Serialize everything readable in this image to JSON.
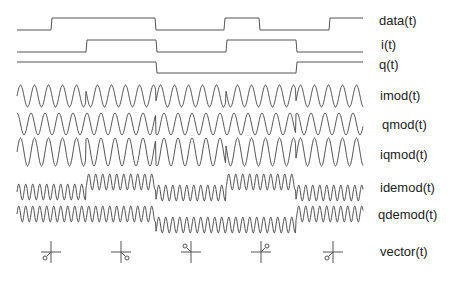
{
  "diagram": {
    "colors": {
      "trace": "#555555",
      "text": "#222222",
      "background": "#ffffff"
    },
    "time_axis": {
      "x_start": 17,
      "x_end": 363,
      "symbol_boundaries": [
        17,
        51,
        86,
        121,
        156,
        191,
        226,
        261,
        296,
        329,
        363
      ]
    },
    "signals": [
      {
        "id": "data",
        "label": "data(t)",
        "type": "digital",
        "high_y": 18,
        "low_y": 30,
        "transitions": [
          [
            17,
            0
          ],
          [
            51,
            1
          ],
          [
            155,
            0
          ],
          [
            224,
            1
          ],
          [
            259,
            0
          ],
          [
            329,
            1
          ]
        ],
        "label_x": 379,
        "label_y": 14
      },
      {
        "id": "i",
        "label": "i(t)",
        "type": "digital",
        "high_y": 40,
        "low_y": 52,
        "transitions": [
          [
            17,
            0
          ],
          [
            86,
            1
          ],
          [
            156,
            0
          ],
          [
            226,
            1
          ],
          [
            296,
            0
          ]
        ],
        "label_x": 381,
        "label_y": 38
      },
      {
        "id": "q",
        "label": "q(t)",
        "type": "digital",
        "high_y": 62,
        "low_y": 73,
        "transitions": [
          [
            17,
            1
          ],
          [
            156,
            0
          ],
          [
            296,
            1
          ]
        ],
        "label_x": 379,
        "label_y": 58
      },
      {
        "id": "imod",
        "label": "imod(t)",
        "type": "carrier",
        "center_y": 96,
        "amplitude": 11,
        "period": 14,
        "offset_per_segment": 0,
        "phases": [
          [
            17,
            0
          ],
          [
            86,
            1
          ],
          [
            156,
            0
          ],
          [
            226,
            1
          ],
          [
            296,
            0
          ]
        ],
        "label_x": 380,
        "label_y": 89
      },
      {
        "id": "qmod",
        "label": "qmod(t)",
        "type": "carrier",
        "center_y": 124,
        "amplitude": 11,
        "period": 14,
        "quad": true,
        "phases": [
          [
            17,
            1
          ],
          [
            156,
            0
          ],
          [
            296,
            1
          ]
        ],
        "label_x": 382,
        "label_y": 118
      },
      {
        "id": "iqmod",
        "label": "iqmod(t)",
        "type": "carrier",
        "center_y": 152,
        "amplitude": 14,
        "period": 14,
        "phases": [
          [
            17,
            0
          ],
          [
            86,
            0.25
          ],
          [
            156,
            -0.25
          ],
          [
            226,
            0.5
          ],
          [
            296,
            0
          ]
        ],
        "label_x": 380,
        "label_y": 148
      },
      {
        "id": "idemod",
        "label": "idemod(t)",
        "type": "demod",
        "period": 7,
        "amplitude": 8,
        "levels": [
          [
            17,
            192
          ],
          [
            86,
            182
          ],
          [
            156,
            193
          ],
          [
            226,
            182
          ],
          [
            296,
            193
          ]
        ],
        "label_x": 380,
        "label_y": 181
      },
      {
        "id": "qdemod",
        "label": "qdemod(t)",
        "type": "demod",
        "period": 7,
        "amplitude": 8,
        "levels": [
          [
            17,
            214
          ],
          [
            156,
            225
          ],
          [
            296,
            214
          ]
        ],
        "label_x": 378,
        "label_y": 208
      },
      {
        "id": "vector",
        "label": "vector(t)",
        "type": "constellation",
        "label_x": 380,
        "label_y": 245,
        "points": [
          {
            "cx": 51,
            "cy": 252,
            "quadrant": "bottom-left"
          },
          {
            "cx": 121,
            "cy": 252,
            "quadrant": "bottom-right"
          },
          {
            "cx": 191,
            "cy": 252,
            "quadrant": "top-left"
          },
          {
            "cx": 261,
            "cy": 252,
            "quadrant": "top-right"
          },
          {
            "cx": 333,
            "cy": 252,
            "quadrant": "bottom-left"
          }
        ]
      }
    ]
  }
}
